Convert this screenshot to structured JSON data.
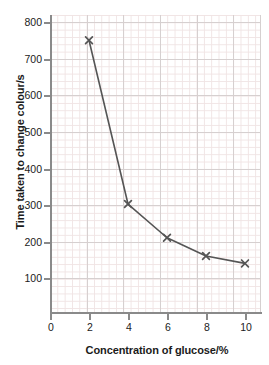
{
  "chart_data": {
    "type": "line",
    "title": "",
    "xlabel": "Concentration of glucose/%",
    "ylabel": "Time taken to change colour/s",
    "x": [
      2,
      4,
      6,
      8,
      10
    ],
    "values": [
      750,
      303,
      211,
      161,
      141
    ],
    "series": [
      {
        "name": "Time taken to change colour",
        "x": [
          2,
          4,
          6,
          8,
          10
        ],
        "values": [
          750,
          303,
          211,
          161,
          141
        ]
      }
    ],
    "xlim": [
      0,
      11
    ],
    "ylim": [
      0,
      800
    ],
    "xticks": [
      0,
      2,
      4,
      6,
      8,
      10
    ],
    "yticks": [
      100,
      200,
      300,
      400,
      500,
      600,
      700,
      800
    ],
    "grid": true,
    "minor_grid": true,
    "legend": "none",
    "marker": "x",
    "line_color": "#555555",
    "marker_color": "#555555",
    "grid_color": "#d6d0d0",
    "minor_grid_color": "#f0e4e4",
    "axis_color": "#8a8a8a",
    "text_color": "#1b1b1b"
  },
  "axes": {
    "y_title": "Time taken to change colour/s",
    "x_title": "Concentration of glucose/%",
    "y_tick_labels": [
      "800",
      "700",
      "600",
      "500",
      "400",
      "300",
      "200",
      "100"
    ],
    "x_tick_labels": [
      "0",
      "2",
      "4",
      "6",
      "8",
      "10"
    ]
  }
}
